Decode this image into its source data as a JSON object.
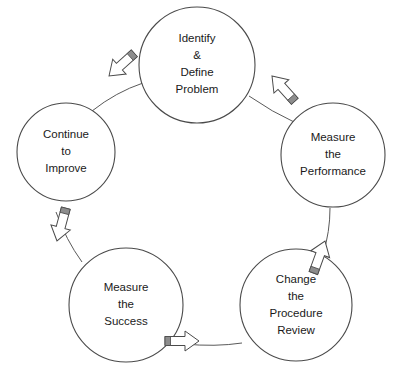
{
  "diagram": {
    "type": "cycle-diagram",
    "direction": "clockwise",
    "colors": {
      "background": "#ffffff",
      "circle_stroke": "#4a4a4a",
      "circle_fill": "#ffffff",
      "connector_stroke": "#5a5a5a",
      "arrow_fill": "#ffffff",
      "arrow_stroke": "#4a4a4a",
      "arrow_band": "#8d8d8d",
      "text": "#1a1a1a"
    },
    "nodes": [
      {
        "id": "identify-define-problem",
        "position": "top",
        "lines": [
          "Identify",
          "&",
          "Define",
          "Problem"
        ],
        "cx": 197,
        "cy": 65,
        "r": 58
      },
      {
        "id": "measure-the-performance",
        "position": "right",
        "lines": [
          "Measure",
          "the",
          "Performance"
        ],
        "cx": 333,
        "cy": 155,
        "r": 52
      },
      {
        "id": "change-the-procedure-review",
        "position": "bottom-right",
        "lines": [
          "Change",
          "the",
          "Procedure",
          "Review"
        ],
        "cx": 296,
        "cy": 305,
        "r": 56
      },
      {
        "id": "measure-the-success",
        "position": "bottom-left",
        "lines": [
          "Measure",
          "the",
          "Success"
        ],
        "cx": 126,
        "cy": 305,
        "r": 57
      },
      {
        "id": "continue-to-improve",
        "position": "left",
        "lines": [
          "Continue",
          "to",
          "Improve"
        ],
        "cx": 66,
        "cy": 152,
        "r": 49
      }
    ],
    "arrows": [
      {
        "id": "arrow-identify-to-measure-performance",
        "from": "identify-define-problem",
        "to": "measure-the-performance",
        "direction": "down-right",
        "rotation": 48,
        "x": 272,
        "y": 76
      },
      {
        "id": "arrow-measure-performance-to-change-procedure",
        "from": "measure-the-performance",
        "to": "change-the-procedure-review",
        "direction": "down",
        "rotation": 110,
        "x": 325,
        "y": 241
      },
      {
        "id": "arrow-change-procedure-to-measure-success",
        "from": "change-the-procedure-review",
        "to": "measure-the-success",
        "direction": "left",
        "rotation": 180,
        "x": 199,
        "y": 341
      },
      {
        "id": "arrow-measure-success-to-continue-improve",
        "from": "measure-the-success",
        "to": "continue-to-improve",
        "direction": "up",
        "rotation": 285,
        "x": 57,
        "y": 241
      },
      {
        "id": "arrow-continue-improve-to-identify",
        "from": "continue-to-improve",
        "to": "identify-define-problem",
        "direction": "up-right",
        "rotation": 318,
        "x": 109,
        "y": 76
      }
    ]
  }
}
